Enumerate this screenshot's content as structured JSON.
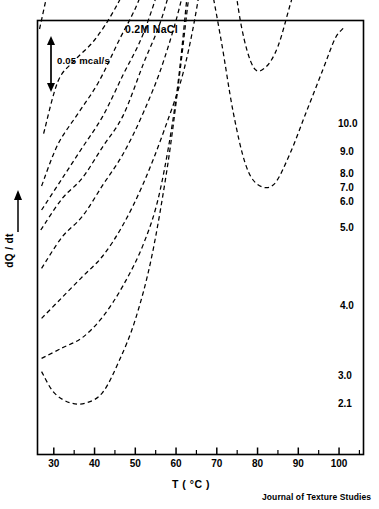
{
  "chart_data": {
    "type": "line",
    "title": "0.2M NaCl",
    "xlabel": "T ( °C )",
    "ylabel": "dQ / dt",
    "xlim": [
      26,
      106
    ],
    "xticks": [
      30,
      40,
      50,
      60,
      70,
      80,
      90,
      100
    ],
    "xtick_labels": [
      "30",
      "40",
      "50",
      "60",
      "70",
      "80",
      "90",
      "100"
    ],
    "minor_tick_step": 5,
    "grid": false,
    "legend_position": "right-of-curve-ends",
    "scale_bar": {
      "label": "0.05 mcal/s",
      "value": 0.05,
      "units": "mcal/s"
    },
    "annotations": {
      "journal_credit": "Journal of Texture Studies",
      "y_axis_arrow": "upward-arrow",
      "series_label_meaning": "protein concentration (%)"
    },
    "series": [
      {
        "name": "10.0",
        "label": "10.0",
        "baseline": 0.0,
        "points": [
          [
            26.5,
            0.1
          ],
          [
            30,
            0.16
          ],
          [
            34,
            0.21
          ],
          [
            38,
            0.25
          ],
          [
            42,
            0.29
          ],
          [
            46,
            0.33
          ],
          [
            50,
            0.38
          ],
          [
            54,
            0.44
          ],
          [
            58,
            0.52
          ],
          [
            62,
            0.62
          ],
          [
            66,
            0.75
          ],
          [
            70,
            0.95
          ],
          [
            73,
            1.18
          ],
          [
            75,
            1.42
          ],
          [
            76.5,
            1.72
          ],
          [
            78,
            2.08
          ],
          [
            79.2,
            2.3
          ],
          [
            80.5,
            2.12
          ],
          [
            82,
            1.8
          ],
          [
            84,
            1.62
          ],
          [
            87,
            1.55
          ],
          [
            90,
            1.52
          ],
          [
            92,
            1.5
          ],
          [
            93.5,
            1.44
          ],
          [
            95.5,
            1.22
          ],
          [
            98,
            1.02
          ],
          [
            100,
            0.92
          ],
          [
            102,
            0.86
          ]
        ]
      },
      {
        "name": "9.0",
        "label": "9.0",
        "baseline": 0.0,
        "points": [
          [
            27.5,
            0.06
          ],
          [
            31,
            0.11
          ],
          [
            35,
            0.13
          ],
          [
            40,
            0.15
          ],
          [
            45,
            0.18
          ],
          [
            50,
            0.22
          ],
          [
            55,
            0.27
          ],
          [
            60,
            0.34
          ],
          [
            64,
            0.43
          ],
          [
            68,
            0.56
          ],
          [
            71,
            0.72
          ],
          [
            74,
            0.96
          ],
          [
            76,
            1.24
          ],
          [
            77.5,
            1.52
          ],
          [
            78.8,
            1.62
          ],
          [
            80.3,
            1.5
          ],
          [
            82,
            1.28
          ],
          [
            83.5,
            1.18
          ],
          [
            85.5,
            1.22
          ],
          [
            88,
            1.4
          ],
          [
            90,
            1.68
          ],
          [
            91.8,
            2.0
          ],
          [
            93.2,
            2.18
          ],
          [
            94.5,
            2.0
          ],
          [
            96,
            1.58
          ],
          [
            97.5,
            1.18
          ],
          [
            99,
            0.92
          ],
          [
            101,
            0.8
          ]
        ]
      },
      {
        "name": "8.0",
        "label": "8.0",
        "baseline": 0.0,
        "points": [
          [
            27,
            0.05
          ],
          [
            31,
            0.09
          ],
          [
            36,
            0.12
          ],
          [
            41,
            0.15
          ],
          [
            46,
            0.19
          ],
          [
            51,
            0.23
          ],
          [
            56,
            0.29
          ],
          [
            61,
            0.37
          ],
          [
            65,
            0.47
          ],
          [
            69,
            0.62
          ],
          [
            72,
            0.8
          ],
          [
            75,
            1.06
          ],
          [
            77,
            1.3
          ],
          [
            78.5,
            1.4
          ],
          [
            80,
            1.3
          ],
          [
            81.5,
            1.12
          ],
          [
            83,
            1.04
          ],
          [
            85,
            1.1
          ],
          [
            87.5,
            1.32
          ],
          [
            90,
            1.66
          ],
          [
            92,
            2.02
          ],
          [
            93.5,
            2.22
          ],
          [
            95,
            2.02
          ],
          [
            96.5,
            1.62
          ],
          [
            98,
            1.22
          ],
          [
            99.5,
            0.98
          ],
          [
            101.5,
            0.88
          ]
        ]
      },
      {
        "name": "7.0",
        "label": "7.0",
        "baseline": 0.0,
        "points": [
          [
            27,
            0.05
          ],
          [
            32,
            0.08
          ],
          [
            37,
            0.11
          ],
          [
            42,
            0.14
          ],
          [
            47,
            0.18
          ],
          [
            52,
            0.22
          ],
          [
            57,
            0.28
          ],
          [
            62,
            0.36
          ],
          [
            66,
            0.46
          ],
          [
            70,
            0.6
          ],
          [
            73,
            0.78
          ],
          [
            76,
            1.02
          ],
          [
            78,
            1.22
          ],
          [
            79.3,
            1.3
          ],
          [
            81,
            1.18
          ],
          [
            82.5,
            1.02
          ],
          [
            84.5,
            0.98
          ],
          [
            87,
            1.16
          ],
          [
            89.5,
            1.48
          ],
          [
            92,
            1.92
          ],
          [
            94,
            2.26
          ],
          [
            95.5,
            2.1
          ],
          [
            97,
            1.68
          ],
          [
            98.5,
            1.26
          ],
          [
            100,
            1.0
          ],
          [
            102,
            0.9
          ]
        ]
      },
      {
        "name": "6.0",
        "label": "6.0",
        "baseline": 0.0,
        "points": [
          [
            26.8,
            0.05
          ],
          [
            32,
            0.08
          ],
          [
            37,
            0.1
          ],
          [
            42,
            0.13
          ],
          [
            47,
            0.16
          ],
          [
            52,
            0.21
          ],
          [
            57,
            0.26
          ],
          [
            62,
            0.34
          ],
          [
            66,
            0.44
          ],
          [
            70,
            0.57
          ],
          [
            73,
            0.74
          ],
          [
            76,
            0.98
          ],
          [
            78,
            1.16
          ],
          [
            79.5,
            1.24
          ],
          [
            81,
            1.1
          ],
          [
            83,
            0.94
          ],
          [
            85,
            0.92
          ],
          [
            87.5,
            1.1
          ],
          [
            90,
            1.46
          ],
          [
            92.5,
            1.96
          ],
          [
            94.5,
            2.34
          ],
          [
            96,
            2.14
          ],
          [
            97.5,
            1.7
          ],
          [
            99,
            1.24
          ],
          [
            100.5,
            0.98
          ],
          [
            102.5,
            0.88
          ]
        ]
      },
      {
        "name": "5.0",
        "label": "5.0",
        "baseline": 0.0,
        "points": [
          [
            27,
            0.04
          ],
          [
            32,
            0.07
          ],
          [
            37,
            0.09
          ],
          [
            42,
            0.12
          ],
          [
            47,
            0.15
          ],
          [
            52,
            0.19
          ],
          [
            57,
            0.24
          ],
          [
            62,
            0.31
          ],
          [
            66,
            0.4
          ],
          [
            70,
            0.52
          ],
          [
            73,
            0.68
          ],
          [
            76,
            0.9
          ],
          [
            78,
            1.06
          ],
          [
            79.5,
            1.12
          ],
          [
            81,
            1.0
          ],
          [
            83,
            0.86
          ],
          [
            85.5,
            0.86
          ],
          [
            88,
            1.04
          ],
          [
            90.5,
            1.4
          ],
          [
            93,
            1.9
          ],
          [
            95,
            2.26
          ],
          [
            96.5,
            2.06
          ],
          [
            98,
            1.62
          ],
          [
            99.5,
            1.18
          ],
          [
            101,
            0.94
          ],
          [
            103,
            0.86
          ]
        ]
      },
      {
        "name": "4.0",
        "label": "4.0",
        "baseline": 0.0,
        "points": [
          [
            27,
            0.04
          ],
          [
            32,
            0.06
          ],
          [
            37,
            0.08
          ],
          [
            42,
            0.1
          ],
          [
            47,
            0.13
          ],
          [
            52,
            0.17
          ],
          [
            57,
            0.22
          ],
          [
            62,
            0.28
          ],
          [
            66,
            0.36
          ],
          [
            69,
            0.45
          ],
          [
            71.5,
            0.58
          ],
          [
            73.5,
            0.72
          ],
          [
            75,
            0.8
          ],
          [
            77.5,
            0.82
          ],
          [
            80,
            0.8
          ],
          [
            82,
            0.82
          ],
          [
            84,
            0.94
          ],
          [
            86,
            1.18
          ],
          [
            88,
            1.48
          ],
          [
            89.8,
            1.64
          ],
          [
            91.5,
            1.52
          ],
          [
            93.5,
            1.2
          ],
          [
            95.5,
            0.88
          ],
          [
            97.5,
            0.68
          ],
          [
            99.5,
            0.58
          ],
          [
            101.5,
            0.54
          ]
        ]
      },
      {
        "name": "3.0",
        "label": "3.0",
        "baseline": 0.0,
        "points": [
          [
            27,
            0.04
          ],
          [
            32,
            0.05
          ],
          [
            37,
            0.06
          ],
          [
            42,
            0.08
          ],
          [
            47,
            0.11
          ],
          [
            52,
            0.15
          ],
          [
            56,
            0.2
          ],
          [
            60,
            0.29
          ],
          [
            63,
            0.4
          ],
          [
            65.5,
            0.5
          ],
          [
            67.5,
            0.54
          ],
          [
            70,
            0.52
          ],
          [
            73,
            0.44
          ],
          [
            76,
            0.36
          ],
          [
            79,
            0.32
          ],
          [
            82,
            0.32
          ],
          [
            85,
            0.34
          ],
          [
            88,
            0.38
          ],
          [
            91,
            0.42
          ],
          [
            94,
            0.46
          ],
          [
            97,
            0.5
          ],
          [
            100,
            0.52
          ],
          [
            102,
            0.53
          ]
        ]
      },
      {
        "name": "2.1",
        "label": "2.1",
        "baseline": 0.0,
        "points": [
          [
            27,
            0.06
          ],
          [
            30,
            0.04
          ],
          [
            34,
            0.03
          ],
          [
            38,
            0.03
          ],
          [
            42,
            0.04
          ],
          [
            46,
            0.07
          ],
          [
            50,
            0.11
          ],
          [
            54,
            0.17
          ],
          [
            58,
            0.26
          ],
          [
            61,
            0.35
          ],
          [
            63.5,
            0.43
          ],
          [
            65.5,
            0.46
          ],
          [
            68,
            0.44
          ],
          [
            71,
            0.38
          ],
          [
            74,
            0.31
          ],
          [
            77,
            0.26
          ],
          [
            80,
            0.24
          ],
          [
            84,
            0.24
          ],
          [
            88,
            0.27
          ],
          [
            92,
            0.31
          ],
          [
            96,
            0.35
          ],
          [
            99,
            0.38
          ],
          [
            101,
            0.39
          ]
        ]
      }
    ]
  }
}
